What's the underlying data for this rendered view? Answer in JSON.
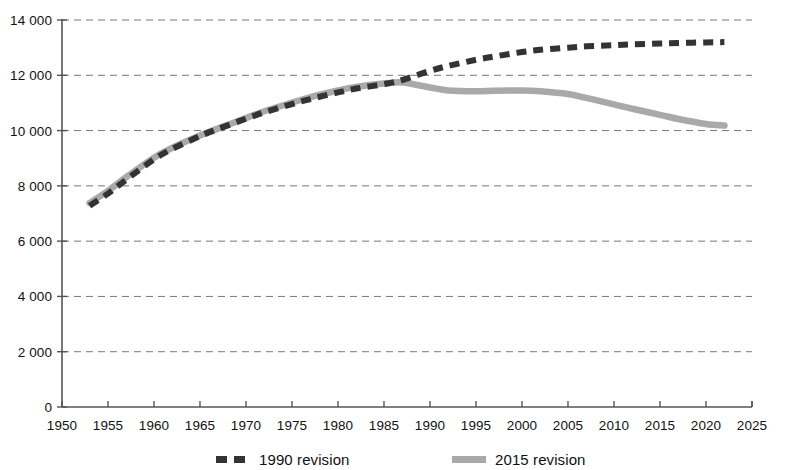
{
  "chart_data": {
    "type": "line",
    "title": "",
    "subtitle": "",
    "xlabel": "",
    "ylabel": "",
    "xlim": [
      1950,
      2025
    ],
    "ylim": [
      0,
      14000
    ],
    "grid": "horizontal-dashed",
    "legend_position": "bottom",
    "x_ticks": [
      1950,
      1955,
      1960,
      1965,
      1970,
      1975,
      1980,
      1985,
      1990,
      1995,
      2000,
      2005,
      2010,
      2015,
      2020,
      2025
    ],
    "x_tick_labels": [
      "1950",
      "1955",
      "1960",
      "1965",
      "1970",
      "1975",
      "1980",
      "1985",
      "1990",
      "1995",
      "2000",
      "2005",
      "2010",
      "2015",
      "2020",
      "2025"
    ],
    "y_ticks": [
      0,
      2000,
      4000,
      6000,
      8000,
      10000,
      12000,
      14000
    ],
    "y_tick_labels": [
      "0",
      "2 000",
      "4 000",
      "6 000",
      "8 000",
      "10 000",
      "12 000",
      "14 000"
    ],
    "series": [
      {
        "name": "1990 revision",
        "style": "dashed",
        "color": "#333333",
        "x": [
          1953,
          1955,
          1957,
          1960,
          1962,
          1965,
          1967,
          1970,
          1972,
          1975,
          1977,
          1980,
          1982,
          1985,
          1987,
          1990,
          1992,
          1995,
          1997,
          2000,
          2002,
          2005,
          2007,
          2010,
          2012,
          2015,
          2017,
          2020,
          2022
        ],
        "values": [
          7280,
          7720,
          8230,
          8960,
          9340,
          9800,
          10060,
          10430,
          10660,
          10960,
          11140,
          11380,
          11520,
          11680,
          11830,
          12160,
          12340,
          12560,
          12680,
          12840,
          12920,
          13000,
          13050,
          13090,
          13120,
          13150,
          13170,
          13190,
          13200
        ]
      },
      {
        "name": "2015 revision",
        "style": "solid",
        "color": "#a9a9a9",
        "x": [
          1953,
          1955,
          1957,
          1960,
          1962,
          1965,
          1967,
          1970,
          1972,
          1975,
          1977,
          1980,
          1982,
          1985,
          1987,
          1990,
          1992,
          1995,
          1997,
          2000,
          2002,
          2005,
          2007,
          2010,
          2012,
          2015,
          2017,
          2020,
          2022
        ],
        "values": [
          7380,
          7820,
          8320,
          9020,
          9380,
          9820,
          10080,
          10450,
          10700,
          11010,
          11210,
          11450,
          11580,
          11700,
          11740,
          11560,
          11450,
          11420,
          11440,
          11450,
          11420,
          11320,
          11180,
          10950,
          10790,
          10570,
          10420,
          10240,
          10180
        ]
      }
    ]
  },
  "legend": {
    "entries": [
      {
        "label": "1990 revision",
        "style": "dashed"
      },
      {
        "label": "2015 revision",
        "style": "solid"
      }
    ]
  },
  "axis": {
    "line_color": "#555555",
    "grid_color": "#777777"
  }
}
